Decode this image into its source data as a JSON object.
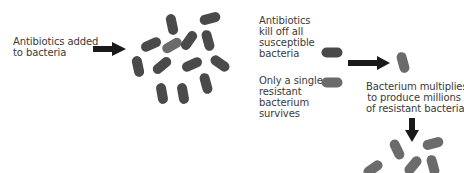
{
  "diagram": {
    "labels": {
      "step1": [
        "Antibiotics added",
        "to bacteria"
      ],
      "step2": [
        "Antibiotics",
        "kill off all",
        "susceptible",
        "bacteria"
      ],
      "step3": [
        "Only a single",
        "resistant",
        "bacterium",
        "survives"
      ],
      "step4": [
        "Bacterium multiplies",
        "to produce millions",
        "of resistant bacteria"
      ]
    },
    "colors": {
      "susceptible_bacterium": "#4a4a4a",
      "resistant_bacterium": "#6b6b6b",
      "arrow": "#1a1a1a",
      "text": "#3a3a3a"
    },
    "icons": {
      "arrow_right": "arrow-right-icon",
      "arrow_down": "arrow-down-icon",
      "bacterium": "bacterium-icon"
    }
  }
}
